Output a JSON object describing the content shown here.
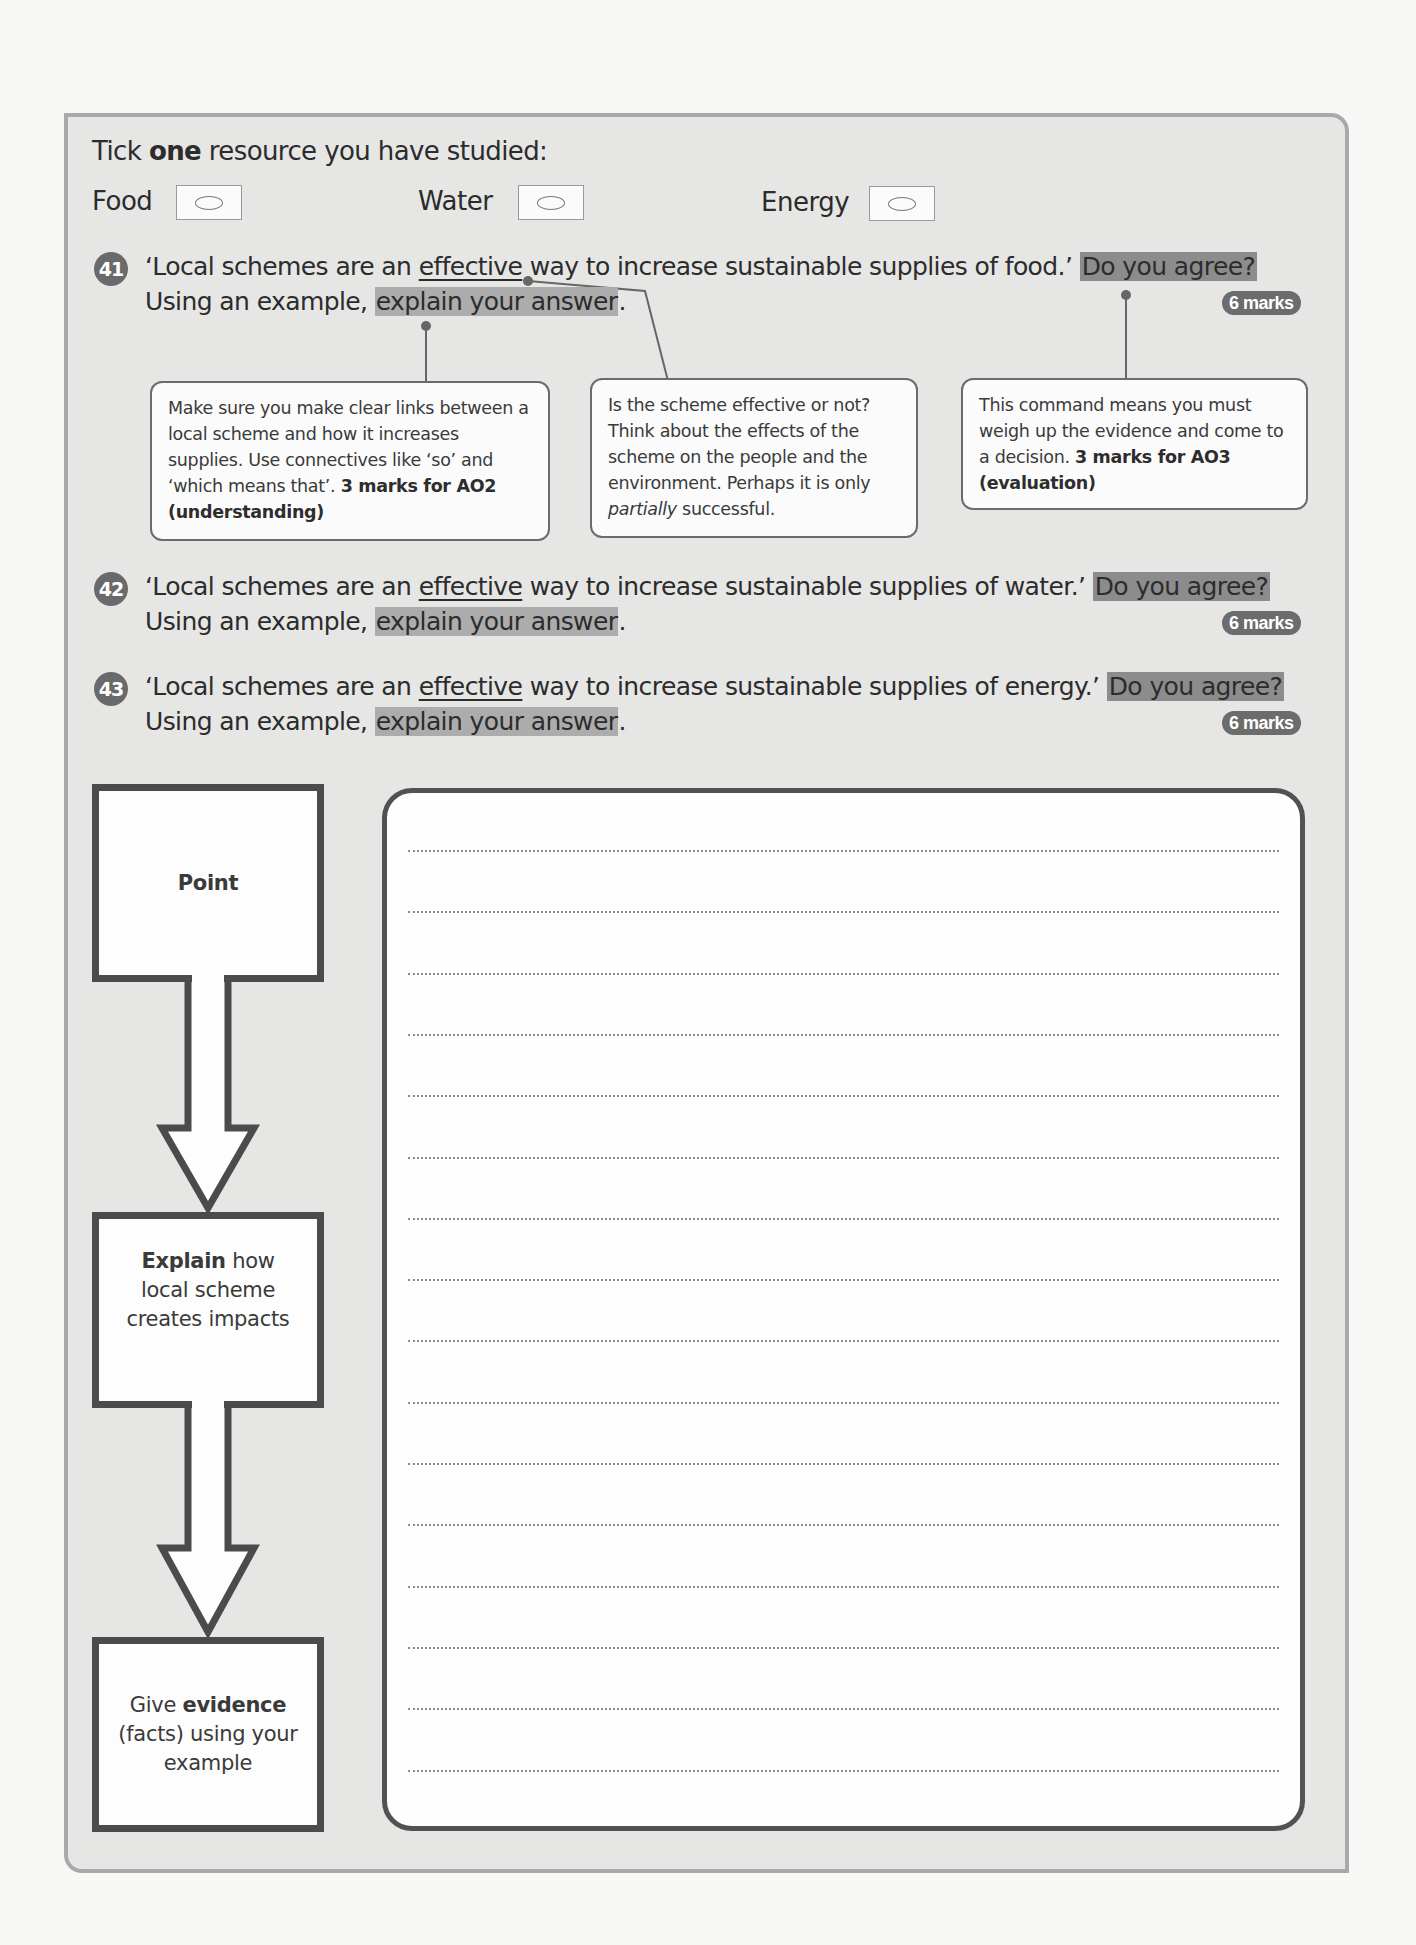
{
  "resource_selection": {
    "prompt_prefix": "Tick ",
    "prompt_bold": "one",
    "prompt_suffix": " resource you have studied:",
    "options": [
      {
        "label": "Food"
      },
      {
        "label": "Water"
      },
      {
        "label": "Energy"
      }
    ]
  },
  "questions": [
    {
      "number": "41",
      "line1_prefix": "‘Local schemes are an ",
      "underlined": "effective",
      "line1_middle": " way to increase sustainable supplies of food.’ ",
      "command_highlight": "Do you agree?",
      "line2_prefix": "Using an example, ",
      "explain_highlight": "explain your answer",
      "line2_suffix": ".",
      "marks": "6 marks"
    },
    {
      "number": "42",
      "line1_prefix": "‘Local schemes are an ",
      "underlined": "effective",
      "line1_middle": " way to increase sustainable supplies of water.’ ",
      "command_highlight": "Do you agree?",
      "line2_prefix": "Using an example, ",
      "explain_highlight": "explain your answer",
      "line2_suffix": ".",
      "marks": "6 marks"
    },
    {
      "number": "43",
      "line1_prefix": "‘Local schemes are an ",
      "underlined": "effective",
      "line1_middle": " way to increase sustainable supplies of energy.’ ",
      "command_highlight": "Do you agree?",
      "line2_prefix": "Using an example, ",
      "explain_highlight": "explain your answer",
      "line2_suffix": ".",
      "marks": "6 marks"
    }
  ],
  "callouts": [
    {
      "text": "Make sure you make clear links between a local scheme and how it increases supplies. Use connectives like ‘so’ and ‘which means that’. ",
      "bold": "3 marks for AO2 (understanding)"
    },
    {
      "text_prefix": "Is the scheme effective or not? Think about the effects of the scheme on the people and the environment. Perhaps it is only ",
      "italic": "partially",
      "text_suffix": " successful."
    },
    {
      "text": "This command means you must weigh up the evidence and come to a decision. ",
      "bold": "3 marks for AO3 (evaluation)"
    }
  ],
  "flow": [
    {
      "bold": "Point",
      "text": ""
    },
    {
      "bold": "Explain",
      "text": " how local scheme creates impacts"
    },
    {
      "prefix": "Give ",
      "bold": "evidence",
      "text": " (facts) using your example"
    }
  ],
  "answer_area": {
    "line_count": 16
  },
  "colors": {
    "panel_bg": "#e6e6e5",
    "panel_border": "#a9a9a9",
    "highlight_dark": "#8c8c8c",
    "highlight_light": "#acacac",
    "marks_badge": "#6c6c6c",
    "flow_border": "#4b4b4b"
  }
}
